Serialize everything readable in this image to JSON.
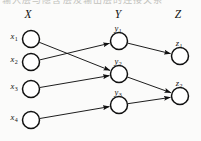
{
  "figure": {
    "background_color": "#fbfbfa",
    "ink_color": "#111111",
    "scan_artifact_text": "输入层与隐含层及输出层的连接关系"
  },
  "headers": [
    {
      "id": "X",
      "label": "X",
      "x": 28,
      "y": 14
    },
    {
      "id": "Y",
      "label": "Y",
      "x": 118,
      "y": 14
    },
    {
      "id": "Z",
      "label": "Z",
      "x": 178,
      "y": 14
    }
  ],
  "nodes": [
    {
      "id": "x1",
      "base": "x",
      "sub": "1",
      "cx": 31,
      "cy": 39,
      "r": 8.5,
      "label_x": 14,
      "label_y": 36,
      "label_pos": "left"
    },
    {
      "id": "x2",
      "base": "x",
      "sub": "2",
      "cx": 31,
      "cy": 62,
      "r": 8.5,
      "label_x": 14,
      "label_y": 59,
      "label_pos": "left"
    },
    {
      "id": "x3",
      "base": "x",
      "sub": "3",
      "cx": 31,
      "cy": 89,
      "r": 8.5,
      "label_x": 14,
      "label_y": 86,
      "label_pos": "left"
    },
    {
      "id": "x4",
      "base": "x",
      "sub": "4",
      "cx": 31,
      "cy": 120,
      "r": 8.5,
      "label_x": 14,
      "label_y": 117,
      "label_pos": "left"
    },
    {
      "id": "y1",
      "base": "y",
      "sub": "1",
      "cx": 119,
      "cy": 41,
      "r": 8.5,
      "label_x": 118,
      "label_y": 28,
      "label_pos": "above"
    },
    {
      "id": "y2",
      "base": "y",
      "sub": "2",
      "cx": 119,
      "cy": 74,
      "r": 8.5,
      "label_x": 118,
      "label_y": 61,
      "label_pos": "above"
    },
    {
      "id": "y3",
      "base": "y",
      "sub": "3",
      "cx": 119,
      "cy": 105,
      "r": 8.5,
      "label_x": 118,
      "label_y": 92,
      "label_pos": "above"
    },
    {
      "id": "z1",
      "base": "z",
      "sub": "1",
      "cx": 180,
      "cy": 56,
      "r": 8.5,
      "label_x": 179,
      "label_y": 43,
      "label_pos": "above"
    },
    {
      "id": "z2",
      "base": "z",
      "sub": "2",
      "cx": 180,
      "cy": 96,
      "r": 8.5,
      "label_x": 179,
      "label_y": 83,
      "label_pos": "above"
    }
  ],
  "edges": [
    {
      "id": "x1-y2",
      "from": "x1",
      "to": "y2"
    },
    {
      "id": "x2-y1",
      "from": "x2",
      "to": "y1"
    },
    {
      "id": "x3-y2",
      "from": "x3",
      "to": "y2"
    },
    {
      "id": "x4-y3",
      "from": "x4",
      "to": "y3"
    },
    {
      "id": "y1-z1",
      "from": "y1",
      "to": "z1"
    },
    {
      "id": "y2-z2",
      "from": "y2",
      "to": "z2"
    },
    {
      "id": "y3-z2",
      "from": "y3",
      "to": "z2"
    }
  ]
}
